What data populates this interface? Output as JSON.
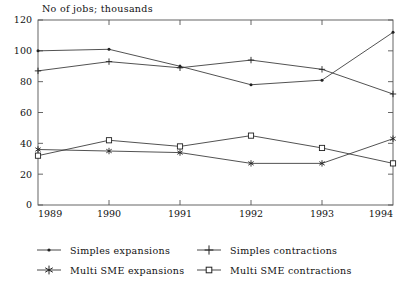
{
  "chart_data": {
    "type": "line",
    "title": "No of jobs; thousands",
    "xlabel": "",
    "ylabel": "",
    "categories": [
      "1989",
      "1990",
      "1991",
      "1992",
      "1993",
      "1994"
    ],
    "x": [
      1989,
      1990,
      1991,
      1992,
      1993,
      1994
    ],
    "xlim": [
      1989,
      1994
    ],
    "ylim": [
      0,
      120
    ],
    "yticks": [
      0,
      20,
      40,
      60,
      80,
      100,
      120
    ],
    "xticks": [
      "1989",
      "1990",
      "1991",
      "1992",
      "1993",
      "1994"
    ],
    "grid": false,
    "legend_position": "below",
    "series": [
      {
        "name": "Simples expansions",
        "marker": "dot",
        "color": "#333333",
        "values": [
          100,
          101,
          90,
          78,
          81,
          112
        ]
      },
      {
        "name": "Simples contractions",
        "marker": "plus",
        "color": "#333333",
        "values": [
          87,
          93,
          89,
          94,
          88,
          72
        ]
      },
      {
        "name": "Multi SME expansions",
        "marker": "star",
        "color": "#333333",
        "values": [
          36,
          35,
          34,
          27,
          27,
          43
        ]
      },
      {
        "name": "Multi SME contractions",
        "marker": "square",
        "color": "#333333",
        "values": [
          32,
          42,
          38,
          45,
          37,
          27
        ]
      }
    ]
  },
  "legend": {
    "entries": [
      {
        "label": "Simples expansions",
        "marker": "dot"
      },
      {
        "label": "Simples contractions",
        "marker": "plus"
      },
      {
        "label": "Multi SME expansions",
        "marker": "star"
      },
      {
        "label": "Multi SME contractions",
        "marker": "square"
      }
    ]
  },
  "colors": {
    "line": "#333333",
    "axis": "#555555",
    "text": "#111111",
    "background": "#ffffff"
  }
}
